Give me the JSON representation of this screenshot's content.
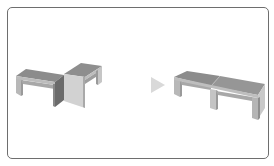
{
  "figure": {
    "frame": {
      "border_color": "#6e6e6e",
      "background": "#ffffff"
    },
    "colors": {
      "top_face": "#8c8c8c",
      "top_face_second": "#959595",
      "front_lip": "#b9b9b9",
      "end_face_dark": "#6b6b6b",
      "end_face_light": "#d2d2d2",
      "leg_face": "#c4c4c4",
      "leg_inner": "#9a9a9a",
      "underside": "#a6a6a6",
      "arrow": "#d9d9d9"
    },
    "panels": [
      {
        "id": "before",
        "label": "",
        "objects": [
          "bench-left",
          "bench-rotated"
        ]
      },
      {
        "id": "after",
        "label": "",
        "objects": [
          "bench-combined"
        ]
      }
    ],
    "arrow": {
      "icon": "play-arrow-icon",
      "direction": "right"
    }
  }
}
